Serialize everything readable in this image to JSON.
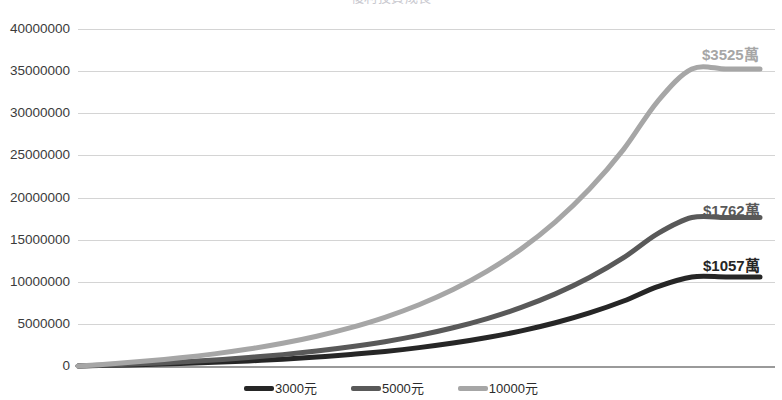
{
  "chart_data": {
    "type": "line",
    "title": "複利投資成長",
    "xlabel": "",
    "ylabel": "",
    "ylim": [
      0,
      40000000
    ],
    "ytick_labels": [
      "40000000",
      "35000000",
      "30000000",
      "25000000",
      "20000000",
      "15000000",
      "10000000",
      "5000000",
      "0"
    ],
    "ytick_values": [
      40000000,
      35000000,
      30000000,
      25000000,
      20000000,
      15000000,
      10000000,
      5000000,
      0
    ],
    "grid": true,
    "legend_position": "bottom",
    "x": [
      0,
      2,
      4,
      6,
      8,
      10,
      12,
      14,
      16,
      18,
      20,
      22,
      24,
      26,
      28,
      30,
      32,
      34,
      36,
      38,
      40
    ],
    "series": [
      {
        "name": "3000元",
        "color": "#262626",
        "end_label": "$1057萬",
        "end_value": 10570000,
        "values": [
          0,
          79000,
          175000,
          291000,
          432000,
          603000,
          810000,
          1061000,
          1365000,
          1733000,
          2180000,
          2721000,
          3377000,
          4171000,
          5134000,
          6300000,
          7713000,
          9425000,
          10570000,
          10570000,
          10570000
        ]
      },
      {
        "name": "5000元",
        "color": "#595959",
        "end_label": "$1762萬",
        "end_value": 17620000,
        "values": [
          0,
          131000,
          292000,
          486000,
          720000,
          1005000,
          1351000,
          1769000,
          2276000,
          2889000,
          3634000,
          4536000,
          5629000,
          6952000,
          8557000,
          10501000,
          12856000,
          15709000,
          17620000,
          17620000,
          17620000
        ]
      },
      {
        "name": "10000元",
        "color": "#a6a6a6",
        "end_label": "$3525萬",
        "end_value": 35250000,
        "values": [
          0,
          263000,
          583000,
          972000,
          1441000,
          2010000,
          2701000,
          3538000,
          4553000,
          5779000,
          7268000,
          9072000,
          11259000,
          13904000,
          17114000,
          21002000,
          25712000,
          31418000,
          35250000,
          35250000,
          35250000
        ]
      }
    ],
    "legend": [
      {
        "label": "3000元",
        "color": "#262626"
      },
      {
        "label": "5000元",
        "color": "#595959"
      },
      {
        "label": "10000元",
        "color": "#a6a6a6"
      }
    ]
  }
}
